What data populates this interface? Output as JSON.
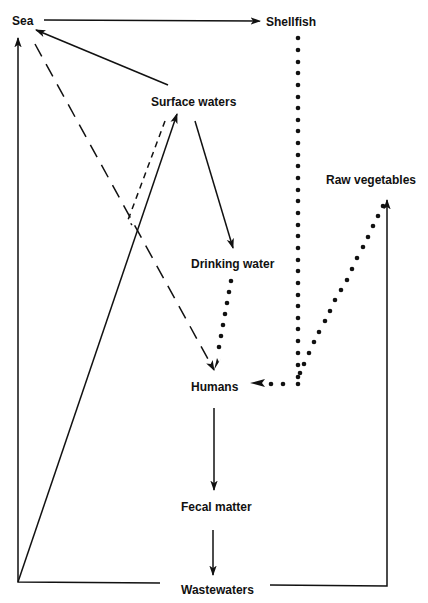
{
  "diagram": {
    "title": "",
    "nodes": [
      {
        "id": "sea",
        "label": "Sea",
        "x": 12,
        "y": 14
      },
      {
        "id": "shellfish",
        "label": "Shellfish",
        "x": 266,
        "y": 15
      },
      {
        "id": "surface_waters",
        "label": "Surface waters",
        "x": 151,
        "y": 95
      },
      {
        "id": "raw_vegetables",
        "label": "Raw vegetables",
        "x": 326,
        "y": 173
      },
      {
        "id": "drinking_water",
        "label": "Drinking water",
        "x": 191,
        "y": 257
      },
      {
        "id": "humans",
        "label": "Humans",
        "x": 191,
        "y": 380
      },
      {
        "id": "fecal_matter",
        "label": "Fecal matter",
        "x": 181,
        "y": 500
      },
      {
        "id": "wastewaters",
        "label": "Wastewaters",
        "x": 181,
        "y": 583
      }
    ],
    "edges": [
      {
        "from": "sea",
        "to": "shellfish",
        "style": "solid"
      },
      {
        "from": "surface_waters",
        "to": "sea",
        "style": "solid"
      },
      {
        "from": "surface_waters",
        "to": "drinking_water",
        "style": "solid"
      },
      {
        "from": "wastewaters",
        "to": "surface_waters",
        "style": "solid"
      },
      {
        "from": "wastewaters",
        "to": "sea",
        "style": "solid"
      },
      {
        "from": "wastewaters",
        "to": "raw_vegetables",
        "style": "solid"
      },
      {
        "from": "humans",
        "to": "fecal_matter",
        "style": "solid"
      },
      {
        "from": "fecal_matter",
        "to": "wastewaters",
        "style": "solid"
      },
      {
        "from": "sea",
        "to": "humans",
        "style": "long-dashed"
      },
      {
        "from": "surface_waters",
        "to": "humans",
        "style": "short-dashed"
      },
      {
        "from": "drinking_water",
        "to": "humans",
        "style": "dotted"
      },
      {
        "from": "shellfish",
        "to": "humans",
        "style": "dotted"
      },
      {
        "from": "raw_vegetables",
        "to": "humans",
        "style": "dotted"
      }
    ],
    "colors": {
      "line": "#111111",
      "background": "#ffffff"
    }
  }
}
